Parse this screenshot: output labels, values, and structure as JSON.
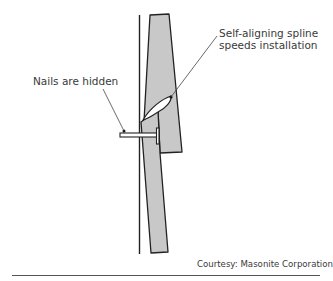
{
  "figure": {
    "callouts": {
      "spline": [
        "Self-aligning spline",
        "speeds installation"
      ],
      "nails": "Nails are hidden"
    },
    "credit": "Courtesy:  Masonite Corporation"
  },
  "colors": {
    "board_fill": "#c8c8c8",
    "line": "#222222",
    "text": "#3a3a3a"
  }
}
